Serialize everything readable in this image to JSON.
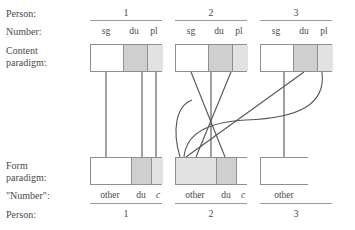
{
  "figure": {
    "type": "linguistic-paradigm-mapping-diagram",
    "row_labels": {
      "person_top": "Person:",
      "number_top": "Number:",
      "content_paradigm_line1": "Content",
      "content_paradigm_line2": "paradigm:",
      "form_paradigm_line1": "Form",
      "form_paradigm_line2": "paradigm:",
      "number_quoted": "\"Number\":",
      "person_bottom": "Person:"
    },
    "persons": [
      "1",
      "2",
      "3"
    ],
    "content_number_headers": [
      "sg",
      "du",
      "pl"
    ],
    "content_paradigm": [
      {
        "person": "1",
        "cells": [
          {
            "label": "sg",
            "shade": "white"
          },
          {
            "label": "du",
            "shade": "dark"
          },
          {
            "label": "pl",
            "shade": "light"
          }
        ]
      },
      {
        "person": "2",
        "cells": [
          {
            "label": "sg",
            "shade": "white"
          },
          {
            "label": "du",
            "shade": "dark"
          },
          {
            "label": "pl",
            "shade": "light"
          }
        ]
      },
      {
        "person": "3",
        "cells": [
          {
            "label": "sg",
            "shade": "white"
          },
          {
            "label": "du",
            "shade": "dark"
          },
          {
            "label": "pl",
            "shade": "light"
          }
        ]
      }
    ],
    "form_paradigm": [
      {
        "person": "1",
        "cells": [
          {
            "label": "other",
            "shade": "white"
          },
          {
            "label": "du",
            "shade": "dark"
          },
          {
            "label": "c",
            "shade": "light",
            "italic": true
          }
        ]
      },
      {
        "person": "2",
        "cells": [
          {
            "label": "other",
            "shade": "light"
          },
          {
            "label": "du",
            "shade": "dark"
          },
          {
            "label": "c",
            "shade": "white",
            "italic": true
          }
        ]
      },
      {
        "person": "3",
        "cells": [
          {
            "label": "other",
            "shade": "white"
          }
        ]
      }
    ],
    "colors": {
      "shade_dark": "#cfcfcf",
      "shade_light": "#e2e2e2",
      "shade_white": "#ffffff",
      "box_border": "#8f8f8f",
      "rule": "#9a9a9a",
      "link": "#555555",
      "text": "#4a4a4a"
    }
  }
}
